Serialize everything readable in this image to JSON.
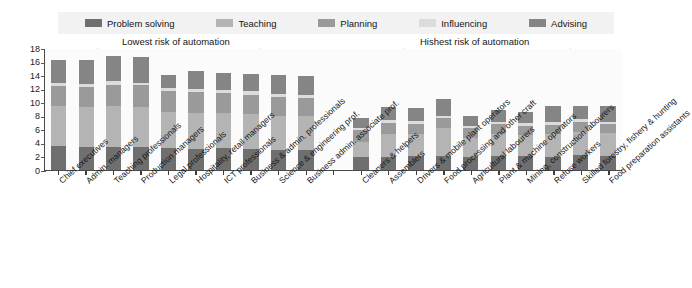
{
  "chart_data": {
    "type": "bar",
    "subtype": "stacked-bar",
    "title": "",
    "xlabel": "",
    "ylabel": "",
    "ylim": [
      0,
      18
    ],
    "yticks": [
      18,
      16,
      14,
      12,
      10,
      8,
      6,
      4,
      2,
      0
    ],
    "grid": false,
    "legend_position": "top",
    "stack_order_bottom_to_top": [
      "Problem solving",
      "Teaching",
      "Planning",
      "Influencing",
      "Advising"
    ],
    "categories": [
      "Chief executives",
      "Admin. managers",
      "Teaching professionals",
      "Production managers",
      "Legal professionals",
      "Hospitality, retail managers",
      "ICT professionals",
      "Business & admin. professionals",
      "Science & engineering prof.",
      "Business admin. associate prof.",
      "",
      "Cleaners & helpers",
      "Assemblers",
      "Drivers & mobile plant operators",
      "Food processing and other craft",
      "Agricultural labourers",
      "Plant & machine operators",
      "Mining, construction labourers",
      "Refuse workers",
      "Skilled forestry, fishery & hunting",
      "Food preparation assistants"
    ],
    "series": [
      {
        "name": "Problem solving",
        "color": "#6f6f6f",
        "values": [
          3.5,
          3.4,
          3.4,
          3.4,
          3.3,
          3.2,
          3.3,
          3.1,
          3.0,
          3.0,
          0,
          1.9,
          2.0,
          2.1,
          2.1,
          1.9,
          2.1,
          2.1,
          2.0,
          2.2,
          2.1
        ]
      },
      {
        "name": "Teaching",
        "color": "#b4b4b4",
        "values": [
          6.0,
          6.0,
          6.1,
          6.0,
          5.4,
          5.3,
          5.2,
          5.2,
          5.1,
          5.0,
          0,
          2.3,
          3.4,
          3.2,
          4.1,
          2.9,
          3.3,
          3.1,
          3.3,
          3.5,
          3.4
        ]
      },
      {
        "name": "Planning",
        "color": "#9a9a9a",
        "values": [
          3.0,
          3.0,
          3.2,
          3.2,
          3.0,
          3.1,
          2.9,
          2.9,
          2.7,
          2.7,
          0,
          1.7,
          1.6,
          1.6,
          1.5,
          1.4,
          1.4,
          1.4,
          1.4,
          1.5,
          1.3
        ]
      },
      {
        "name": "Influencing",
        "color": "#dcdcdc",
        "values": [
          0.4,
          0.4,
          0.5,
          0.4,
          0.5,
          0.5,
          0.5,
          0.5,
          0.5,
          0.5,
          0,
          0.3,
          0.4,
          0.4,
          0.4,
          0.3,
          0.4,
          0.4,
          0.4,
          0.4,
          0.4
        ]
      },
      {
        "name": "Advising",
        "color": "#858585",
        "values": [
          3.4,
          3.5,
          3.8,
          3.8,
          2.0,
          2.7,
          2.6,
          2.6,
          2.8,
          2.8,
          0,
          1.6,
          2.0,
          2.0,
          2.4,
          1.6,
          1.8,
          1.7,
          2.5,
          1.9,
          2.3
        ]
      }
    ],
    "totals": [
      16.3,
      16.3,
      17.0,
      16.8,
      14.2,
      14.8,
      14.5,
      14.3,
      14.1,
      14.0,
      0,
      7.8,
      9.4,
      9.3,
      10.5,
      8.1,
      9.0,
      8.7,
      9.6,
      9.5,
      9.5
    ],
    "annotations": [
      {
        "name": "lowest-risk",
        "text": "Lowest risk of automation",
        "arrow": "double"
      },
      {
        "name": "highest-risk",
        "text": "Hishest risk of automation",
        "arrow": "double"
      }
    ]
  },
  "legend": {
    "items": [
      {
        "label": "Problem solving",
        "color": "#6f6f6f"
      },
      {
        "label": "Teaching",
        "color": "#b4b4b4"
      },
      {
        "label": "Planning",
        "color": "#9a9a9a"
      },
      {
        "label": "Influencing",
        "color": "#dcdcdc"
      },
      {
        "label": "Advising",
        "color": "#858585"
      }
    ]
  },
  "axis": {
    "y_ticks": [
      "18",
      "16",
      "14",
      "12",
      "10",
      "8",
      "6",
      "4",
      "2",
      "0"
    ]
  },
  "annotations": {
    "lowest": "Lowest risk of automation",
    "highest": "Hishest risk of automation"
  }
}
